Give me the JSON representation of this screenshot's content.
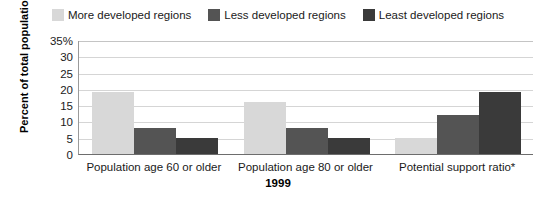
{
  "chart_data": {
    "type": "bar",
    "title": "",
    "xlabel": "1999",
    "ylabel": "Percent of total population",
    "ylim": [
      0,
      35
    ],
    "yticks": [
      "0",
      "5",
      "10",
      "15",
      "20",
      "25",
      "30",
      "35%"
    ],
    "ytick_values": [
      0,
      5,
      10,
      15,
      20,
      25,
      30,
      35
    ],
    "grid": true,
    "legend_position": "top-center",
    "categories": [
      "Population age 60 or older",
      "Population age 80 or older",
      "Potential support ratio*"
    ],
    "series": [
      {
        "name": "More developed regions",
        "color": "#d8d8d8",
        "values": [
          19,
          16,
          5
        ]
      },
      {
        "name": "Less developed regions",
        "color": "#545454",
        "values": [
          8,
          8,
          12
        ]
      },
      {
        "name": "Least developed regions",
        "color": "#3a3a3a",
        "values": [
          5,
          5,
          19
        ]
      }
    ]
  },
  "legend": {
    "items": [
      {
        "label": "More developed regions",
        "swatch_name": "legend-swatch-more-developed"
      },
      {
        "label": "Less developed regions",
        "swatch_name": "legend-swatch-less-developed"
      },
      {
        "label": "Least developed regions",
        "swatch_name": "legend-swatch-least-developed"
      }
    ]
  }
}
